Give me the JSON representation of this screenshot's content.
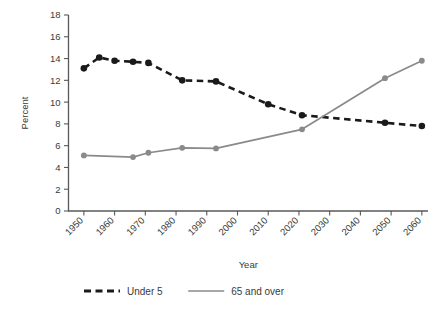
{
  "chart_data": {
    "type": "line",
    "title": "",
    "xlabel": "Year",
    "ylabel": "Percent",
    "xlim": [
      1945,
      2062
    ],
    "ylim": [
      0,
      18
    ],
    "xticks": [
      1950,
      1960,
      1970,
      1980,
      1990,
      2000,
      2010,
      2020,
      2030,
      2040,
      2050,
      2060
    ],
    "xticklabels": [
      "1950",
      "1960",
      "1970",
      "1980",
      "1990",
      "2000",
      "2010",
      "2020",
      "2030",
      "2040",
      "2050",
      "2060"
    ],
    "yticks": [
      0,
      2,
      4,
      6,
      8,
      10,
      12,
      14,
      16,
      18
    ],
    "yticklabels": [
      "0",
      "2",
      "4",
      "6",
      "8",
      "10",
      "12",
      "14",
      "16",
      "18"
    ],
    "grid": false,
    "legend_position": "bottom",
    "series": [
      {
        "name": "Under 5",
        "color": "#1a1a1a",
        "style": "dashed",
        "marker": "circle",
        "x": [
          1950,
          1955,
          1960,
          1966,
          1971,
          1982,
          1993,
          2010,
          2021,
          2048,
          2060
        ],
        "values": [
          13.1,
          14.1,
          13.8,
          13.7,
          13.6,
          12.0,
          11.9,
          9.8,
          8.8,
          8.1,
          7.8
        ]
      },
      {
        "name": "65 and over",
        "color": "#8a8a8a",
        "style": "solid",
        "marker": "circle",
        "x": [
          1950,
          1966,
          1971,
          1982,
          1993,
          2021,
          2048,
          2060
        ],
        "values": [
          5.1,
          4.95,
          5.35,
          5.8,
          5.75,
          7.5,
          12.2,
          13.8
        ]
      }
    ],
    "annotations": []
  },
  "legend": {
    "items": [
      {
        "label": "Under 5",
        "color": "#1a1a1a",
        "style": "dashed"
      },
      {
        "label": "65 and over",
        "color": "#8a8a8a",
        "style": "solid"
      }
    ]
  },
  "axes": {
    "y_title": "Percent",
    "x_title": "Year"
  }
}
